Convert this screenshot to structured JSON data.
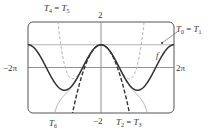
{
  "chart_data": {
    "type": "line",
    "title": "",
    "xlabel": "",
    "ylabel": "",
    "xlim": [
      -6.2832,
      6.2832
    ],
    "ylim": [
      -2,
      2
    ],
    "grid": false,
    "reference_lines": [
      {
        "axis": "y",
        "value": 1
      }
    ],
    "axis_labels": {
      "x_min": "-2π",
      "x_max": "2π",
      "y_max": "2",
      "y_min": "-2"
    },
    "series": [
      {
        "name": "f",
        "label": "f",
        "expr": "cos(x)",
        "style": "solid-thick",
        "color": "#333333"
      },
      {
        "name": "T0 = T1",
        "label_base": "T",
        "label_sub_a": "0",
        "label_sub_b": "1",
        "expr": "1",
        "style": "solid-thin",
        "color": "#9a9a9a"
      },
      {
        "name": "T2 = T3",
        "label_base": "T",
        "label_sub_a": "2",
        "label_sub_b": "3",
        "expr": "1 - x^2/2",
        "style": "dashed-thick",
        "color": "#333333"
      },
      {
        "name": "T4 = T5",
        "label_base": "T",
        "label_sub_a": "4",
        "label_sub_b": "5",
        "expr": "1 - x^2/2 + x^4/24",
        "style": "dashed-thin",
        "color": "#aaaaaa"
      },
      {
        "name": "T6",
        "label_base": "T",
        "label_sub_a": "6",
        "expr": "1 - x^2/2 + x^4/24 - x^6/720",
        "style": "solid-thin",
        "color": "#aaaaaa"
      }
    ]
  },
  "labels": {
    "x_min": "−2π",
    "x_max": "2π",
    "y_max": "2",
    "y_min": "−2",
    "f": "f",
    "T_base": "T",
    "eq": " = ",
    "t45_a": "4",
    "t45_b": "5",
    "t01_a": "0",
    "t01_b": "1",
    "t23_a": "2",
    "t23_b": "3",
    "t6_a": "6"
  }
}
